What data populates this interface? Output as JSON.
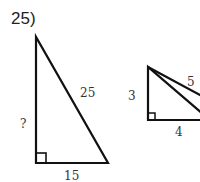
{
  "problem": {
    "number": "25)"
  },
  "triangles": [
    {
      "name": "large-right-triangle",
      "labels": {
        "vertical": "?",
        "hypotenuse": "25",
        "base": "15"
      }
    },
    {
      "name": "small-right-triangle",
      "labels": {
        "vertical": "3",
        "hypotenuse": "5",
        "base": "4"
      }
    }
  ],
  "colors": {
    "stroke": "#111111",
    "text": "#333333"
  }
}
